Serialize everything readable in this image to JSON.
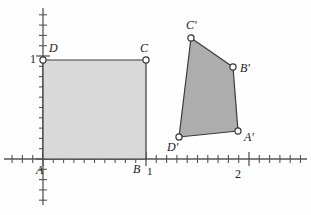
{
  "figure": {
    "colors": {
      "square_fill": "#d9d9d9",
      "quad_fill": "#adadad",
      "stroke": "#3a3a3a",
      "axis": "#555555",
      "vertex_fill": "#ffffff",
      "text": "#1a1a1a"
    }
  },
  "axes": {
    "x_axis": {
      "name": "x-axis",
      "y_px": 159,
      "x_start_px": 4,
      "x_end_px": 307
    },
    "y_axis": {
      "name": "y-axis",
      "x_px": 43,
      "y_start_px": 8,
      "y_end_px": 205
    },
    "origin_px": {
      "x": 43,
      "y": 159
    },
    "unit_px": 103,
    "minor_tick_px": 10.3,
    "tick_labels": [
      {
        "text": "1",
        "axis": "y",
        "value": 1,
        "x_px": 30,
        "y_px": 53
      },
      {
        "text": "1",
        "axis": "x",
        "value": 1,
        "x_px": 147,
        "y_px": 166
      },
      {
        "text": "2",
        "axis": "x",
        "value": 2,
        "x_px": 235,
        "y_px": 168
      }
    ]
  },
  "shapes": [
    {
      "name": "unit-square-ABCD",
      "type": "polygon",
      "fill": "#d9d9d9",
      "points_px": "43,159 146,159 146,60 43,60",
      "vertices": [
        {
          "label": "A",
          "x_px": 43,
          "y_px": 159,
          "coord": [
            0,
            0
          ],
          "dot": false
        },
        {
          "label": "B",
          "x_px": 146,
          "y_px": 159,
          "coord": [
            1,
            0
          ],
          "dot": false
        },
        {
          "label": "C",
          "x_px": 146,
          "y_px": 60,
          "coord": [
            1,
            1
          ],
          "dot": true
        },
        {
          "label": "D",
          "x_px": 43,
          "y_px": 60,
          "coord": [
            0,
            1
          ],
          "dot": true
        }
      ]
    },
    {
      "name": "image-quadrilateral-A'B'C'D'",
      "type": "polygon",
      "fill": "#adadad",
      "points_px": "238,131 233,67 191,38 179,137",
      "vertices": [
        {
          "label": "A'",
          "x_px": 238,
          "y_px": 131,
          "coord": [
            1.9,
            0.27
          ],
          "dot": true
        },
        {
          "label": "B'",
          "x_px": 233,
          "y_px": 67,
          "coord": [
            1.85,
            0.89
          ],
          "dot": true
        },
        {
          "label": "C'",
          "x_px": 191,
          "y_px": 38,
          "coord": [
            1.44,
            1.17
          ],
          "dot": true
        },
        {
          "label": "D'",
          "x_px": 179,
          "y_px": 137,
          "coord": [
            1.32,
            0.21
          ],
          "dot": true
        }
      ]
    }
  ],
  "labels": [
    {
      "name": "vertex-label-A",
      "text": "A",
      "x_px": 36,
      "y_px": 164
    },
    {
      "name": "vertex-label-B",
      "text": "B",
      "x_px": 133,
      "y_px": 163
    },
    {
      "name": "vertex-label-C",
      "text": "C",
      "x_px": 140,
      "y_px": 42
    },
    {
      "name": "vertex-label-D",
      "text": "D",
      "x_px": 49,
      "y_px": 42
    },
    {
      "name": "vertex-label-A-prime",
      "text": "A'",
      "x_px": 244,
      "y_px": 131
    },
    {
      "name": "vertex-label-B-prime",
      "text": "B'",
      "x_px": 240,
      "y_px": 62
    },
    {
      "name": "vertex-label-C-prime",
      "text": "C'",
      "x_px": 186,
      "y_px": 19
    },
    {
      "name": "vertex-label-D-prime",
      "text": "D'",
      "x_px": 167,
      "y_px": 141
    }
  ]
}
